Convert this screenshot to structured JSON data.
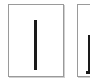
{
  "thumbnails": [
    {
      "index": 1,
      "content": "vertical-bar-glyph",
      "selected": false
    },
    {
      "index": 2,
      "content": "vertical-bar-glyph-partial",
      "selected": false
    }
  ],
  "colors": {
    "page_bg": "#ffffff",
    "border": "#9a9a9a",
    "glyph": "#1a1a1a"
  }
}
